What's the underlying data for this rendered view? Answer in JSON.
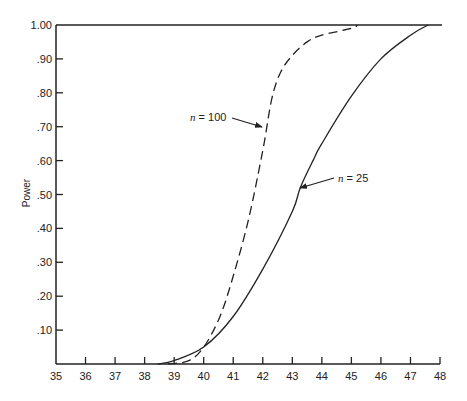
{
  "chart_data": {
    "type": "line",
    "title": "",
    "xlabel": "",
    "ylabel": "Power",
    "xlim": [
      35,
      48
    ],
    "ylim": [
      0,
      1.0
    ],
    "grid": false,
    "legend": null,
    "x_ticks": [
      35,
      36,
      37,
      38,
      39,
      40,
      41,
      42,
      43,
      44,
      45,
      46,
      47,
      48
    ],
    "x_tick_labels": [
      "35",
      "36",
      "37",
      "38",
      "39",
      "40",
      "41",
      "42",
      "43",
      "44",
      "45",
      "46",
      "47",
      "48"
    ],
    "y_ticks": [
      0.1,
      0.2,
      0.3,
      0.4,
      0.5,
      0.6,
      0.7,
      0.8,
      0.9,
      1.0
    ],
    "y_tick_labels": [
      ".10",
      ".20",
      ".30",
      ".40",
      ".50",
      ".60",
      ".70",
      ".80",
      ".90",
      "1.00"
    ],
    "reference_line": {
      "y": 1.0,
      "style": "solid"
    },
    "series": [
      {
        "name": "n = 25",
        "style": "solid",
        "x": [
          38.45,
          39,
          40,
          41,
          42,
          43,
          43.27,
          43.7,
          44,
          45,
          46,
          47,
          47.6
        ],
        "y": [
          0.0,
          0.01,
          0.05,
          0.14,
          0.28,
          0.45,
          0.52,
          0.6,
          0.65,
          0.79,
          0.9,
          0.97,
          1.0
        ]
      },
      {
        "name": "n = 100",
        "style": "dashed",
        "x": [
          38.8,
          39.5,
          40,
          40.5,
          40.9,
          41.5,
          42,
          42.3,
          42.6,
          43,
          43.5,
          44,
          45,
          45.2
        ],
        "y": [
          0.0,
          0.01,
          0.05,
          0.13,
          0.23,
          0.42,
          0.63,
          0.78,
          0.86,
          0.91,
          0.95,
          0.97,
          0.99,
          1.0
        ]
      }
    ],
    "annotations": [
      {
        "text_prefix": "n",
        "text_suffix": " =  100",
        "series": "n = 100",
        "text_pos": [
          190,
          121
        ],
        "arrow_from": [
          232,
          118
        ],
        "arrow_to": [
          262,
          127
        ]
      },
      {
        "text_prefix": "n",
        "text_suffix": " =  25",
        "series": "n = 25",
        "text_pos": [
          338,
          182
        ],
        "arrow_from": [
          334,
          178
        ],
        "arrow_to": [
          300,
          188
        ]
      }
    ]
  }
}
